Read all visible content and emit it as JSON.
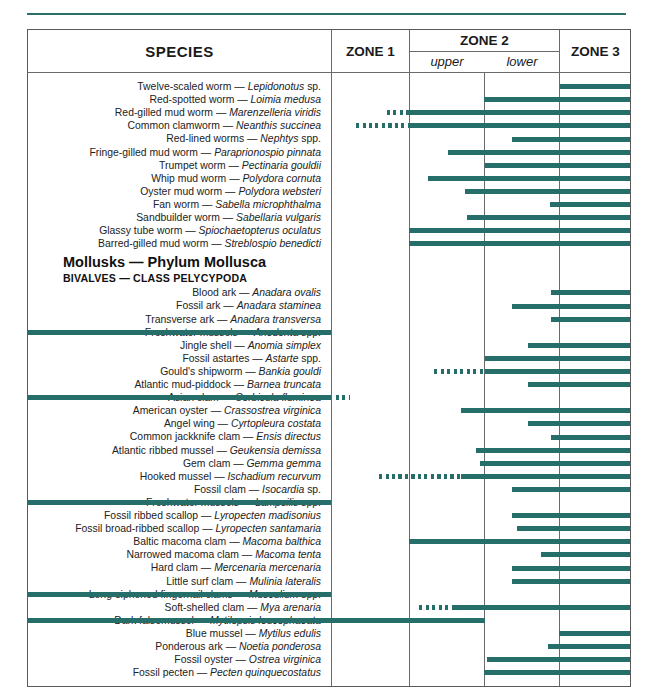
{
  "figure": {
    "type": "range-chart",
    "title_column": "SPECIES",
    "columns": [
      {
        "label": "ZONE 1",
        "sub": []
      },
      {
        "label": "ZONE 2",
        "sub": [
          "upper",
          "lower"
        ]
      },
      {
        "label": "ZONE 3",
        "sub": []
      }
    ],
    "accent_color": "#256e69",
    "rule_color": "#2a6f6a",
    "border_color": "#5a5a5a"
  },
  "header": {
    "species": "SPECIES",
    "zone1": "ZONE 1",
    "zone2": "ZONE 2",
    "zone2_upper": "upper",
    "zone2_lower": "lower",
    "zone3": "ZONE 3"
  },
  "groups": [
    {
      "phylum": "Mollusks — Phylum Mollusca",
      "class": "BIVALVES — CLASS PELYCYPODA"
    }
  ],
  "rows": [
    {
      "common": "Twelve-scaled worm",
      "sci": "Lepidonotus",
      "suffix": " sp.",
      "solid": [
        532,
        602
      ],
      "dashed": null
    },
    {
      "common": "Red-spotted worm",
      "sci": "Loimia medusa",
      "suffix": "",
      "solid": [
        456,
        602
      ],
      "dashed": null
    },
    {
      "common": "Red-gilled mud worm",
      "sci": "Marenzelleria viridis",
      "suffix": "",
      "solid": [
        381,
        602
      ],
      "dashed": [
        359,
        381
      ]
    },
    {
      "common": "Common clamworm",
      "sci": "Neanthis succinea",
      "suffix": "",
      "solid": [
        381,
        602
      ],
      "dashed": [
        328,
        381
      ]
    },
    {
      "common": "Red-lined worms",
      "sci": "Nephtys",
      "suffix": " spp.",
      "solid": [
        484,
        602
      ],
      "dashed": null
    },
    {
      "common": "Fringe-gilled mud worm",
      "sci": "Paraprionospio pinnata",
      "suffix": "",
      "solid": [
        420,
        602
      ],
      "dashed": null
    },
    {
      "common": "Trumpet worm",
      "sci": "Pectinaria gouldii",
      "suffix": "",
      "solid": [
        457,
        602
      ],
      "dashed": null
    },
    {
      "common": "Whip mud worm",
      "sci": "Polydora cornuta",
      "suffix": "",
      "solid": [
        400,
        602
      ],
      "dashed": null
    },
    {
      "common": "Oyster mud worm",
      "sci": "Polydora websteri",
      "suffix": "",
      "solid": [
        437,
        602
      ],
      "dashed": null
    },
    {
      "common": "Fan worm",
      "sci": "Sabella microphthalma",
      "suffix": "",
      "solid": [
        522,
        602
      ],
      "dashed": null
    },
    {
      "common": "Sandbuilder worm",
      "sci": "Sabellaria vulgaris",
      "suffix": "",
      "solid": [
        439,
        602
      ],
      "dashed": null
    },
    {
      "common": "Glassy tube worm",
      "sci": "Spiochaetopterus oculatus",
      "suffix": "",
      "solid": [
        381,
        602
      ],
      "dashed": null
    },
    {
      "common": "Barred-gilled mud worm",
      "sci": "Streblospio benedicti",
      "suffix": "",
      "solid": [
        381,
        602
      ],
      "dashed": null
    },
    {
      "common": "Blood ark",
      "sci": "Anadara ovalis",
      "suffix": "",
      "solid": [
        523,
        602
      ],
      "dashed": null
    },
    {
      "common": "Fossil ark",
      "sci": "Anadara staminea",
      "suffix": "",
      "solid": [
        484,
        602
      ],
      "dashed": null
    },
    {
      "common": "Transverse ark",
      "sci": "Anadara transversa",
      "suffix": "",
      "solid": [
        523,
        602
      ],
      "dashed": null
    },
    {
      "common": "Freshwater mussels",
      "sci": "Anodonta",
      "suffix": " spp.",
      "solid": [
        0,
        303
      ],
      "dashed": null
    },
    {
      "common": "Jingle shell",
      "sci": "Anomia simplex",
      "suffix": "",
      "solid": [
        500,
        602
      ],
      "dashed": null
    },
    {
      "common": "Fossil astartes",
      "sci": "Astarte",
      "suffix": " spp.",
      "solid": [
        457,
        602
      ],
      "dashed": null
    },
    {
      "common": "Gould's shipworm",
      "sci": "Bankia gouldi",
      "suffix": "",
      "solid": [
        457,
        602
      ],
      "dashed": [
        406,
        457
      ]
    },
    {
      "common": "Atlantic mud-piddock",
      "sci": "Barnea truncata",
      "suffix": "",
      "solid": [
        500,
        602
      ],
      "dashed": null
    },
    {
      "common": "Asian clam",
      "sci": "Corbicula fluminea",
      "suffix": "",
      "solid": [
        0,
        303
      ],
      "dashed": [
        308,
        322
      ]
    },
    {
      "common": "American oyster",
      "sci": "Crassostrea virginica",
      "suffix": "",
      "solid": [
        433,
        602
      ],
      "dashed": null
    },
    {
      "common": "Angel wing",
      "sci": "Cyrtopleura costata",
      "suffix": "",
      "solid": [
        500,
        602
      ],
      "dashed": null
    },
    {
      "common": "Common jackknife clam",
      "sci": "Ensis directus",
      "suffix": "",
      "solid": [
        523,
        602
      ],
      "dashed": null
    },
    {
      "common": "Atlantic ribbed mussel",
      "sci": "Geukensia demissa",
      "suffix": "",
      "solid": [
        448,
        602
      ],
      "dashed": null
    },
    {
      "common": "Gem clam",
      "sci": "Gemma gemma",
      "suffix": "",
      "solid": [
        452,
        602
      ],
      "dashed": null
    },
    {
      "common": "Hooked mussel",
      "sci": "Ischadium recurvum",
      "suffix": "",
      "solid": [
        433,
        602
      ],
      "dashed": [
        351,
        433
      ]
    },
    {
      "common": "Fossil clam",
      "sci": "Isocardia",
      "suffix": " sp.",
      "solid": [
        484,
        602
      ],
      "dashed": null
    },
    {
      "common": "Freshwater mussels",
      "sci": "Lampsilis",
      "suffix": " spp.",
      "solid": [
        0,
        303
      ],
      "dashed": null
    },
    {
      "common": "Fossil ribbed scallop",
      "sci": "Lyropecten madisonius",
      "suffix": "",
      "solid": [
        484,
        602
      ],
      "dashed": null
    },
    {
      "common": "Fossil broad-ribbed scallop",
      "sci": "Lyropecten santamaria",
      "suffix": "",
      "solid": [
        489,
        602
      ],
      "dashed": null
    },
    {
      "common": "Baltic macoma clam",
      "sci": "Macoma balthica",
      "suffix": "",
      "solid": [
        381,
        602
      ],
      "dashed": null
    },
    {
      "common": "Narrowed macoma clam",
      "sci": "Macoma tenta",
      "suffix": "",
      "solid": [
        513,
        602
      ],
      "dashed": null
    },
    {
      "common": "Hard clam",
      "sci": "Mercenaria mercenaria",
      "suffix": "",
      "solid": [
        484,
        602
      ],
      "dashed": null
    },
    {
      "common": "Little surf clam",
      "sci": "Mulinia lateralis",
      "suffix": "",
      "solid": [
        484,
        602
      ],
      "dashed": null
    },
    {
      "common": "Long-siphoned fingernail clams",
      "sci": "Musculium",
      "suffix": " spp.",
      "solid": [
        0,
        303
      ],
      "dashed": null
    },
    {
      "common": "Soft-shelled clam",
      "sci": "Mya arenaria",
      "suffix": "",
      "solid": [
        424,
        602
      ],
      "dashed": [
        391,
        424
      ]
    },
    {
      "common": "Dark falsemussel",
      "sci": "Mytilopsis leucophaeata",
      "suffix": "",
      "solid": [
        0,
        457
      ],
      "dashed": null
    },
    {
      "common": "Blue mussel",
      "sci": "Mytilus edulis",
      "suffix": "",
      "solid": [
        531,
        602
      ],
      "dashed": null
    },
    {
      "common": "Ponderous ark",
      "sci": "Noetia ponderosa",
      "suffix": "",
      "solid": [
        520,
        602
      ],
      "dashed": null
    },
    {
      "common": "Fossil oyster",
      "sci": "Ostrea virginica",
      "suffix": "",
      "solid": [
        459,
        602
      ],
      "dashed": null
    },
    {
      "common": "Fossil pecten",
      "sci": "Pecten quinquecostatus",
      "suffix": "",
      "solid": [
        456,
        602
      ],
      "dashed": null
    }
  ]
}
